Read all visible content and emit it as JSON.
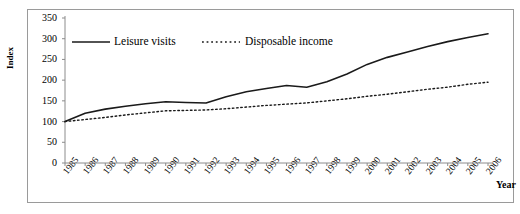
{
  "chart_data": {
    "type": "line",
    "title": "",
    "xlabel": "Year",
    "ylabel": "Index",
    "ylim": [
      0,
      350
    ],
    "ytick_step": 50,
    "yticks": [
      "350",
      "300",
      "250",
      "200",
      "150",
      "100",
      "50",
      "0"
    ],
    "grid": false,
    "legend_position": "top-inside",
    "categories": [
      "1985",
      "1986",
      "1987",
      "1988",
      "1989",
      "1990",
      "1991",
      "1992",
      "1993",
      "1994",
      "1995",
      "1996",
      "1997",
      "1998",
      "1999",
      "2000",
      "2001",
      "2002",
      "2003",
      "2004",
      "2005",
      "2006"
    ],
    "series": [
      {
        "name": "Leisure visits",
        "style": "solid",
        "color": "#1a1a1a",
        "values": [
          100,
          120,
          130,
          137,
          143,
          148,
          146,
          145,
          160,
          172,
          180,
          187,
          183,
          196,
          215,
          238,
          255,
          268,
          281,
          293,
          303,
          312
        ]
      },
      {
        "name": "Disposable income",
        "style": "dotted",
        "color": "#1a1a1a",
        "values": [
          100,
          105,
          110,
          116,
          121,
          126,
          127,
          128,
          131,
          135,
          139,
          142,
          145,
          150,
          155,
          161,
          166,
          172,
          178,
          183,
          190,
          195
        ]
      }
    ]
  },
  "legend": {
    "items": [
      {
        "label": "Leisure visits",
        "style": "solid"
      },
      {
        "label": "Disposable income",
        "style": "dotted"
      }
    ]
  },
  "axes": {
    "y_title": "Index",
    "x_title": "Year"
  },
  "colors": {
    "line": "#1a1a1a",
    "axis": "#8c8c8c",
    "frame": "#9a9a9a",
    "background": "#ffffff"
  }
}
